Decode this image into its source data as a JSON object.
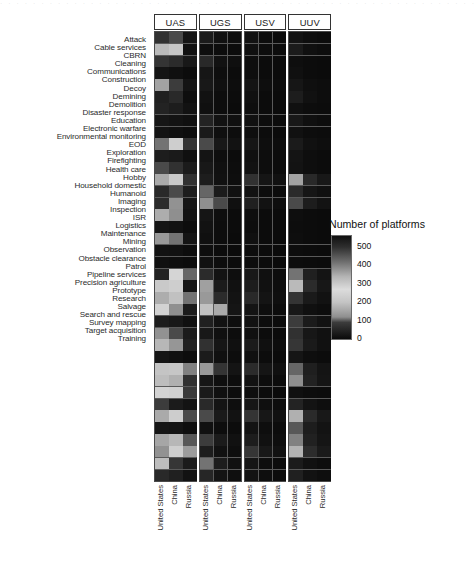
{
  "figure": {
    "kind": "faceted-heatmap",
    "legend_title": "Number of platforms",
    "legend_ticks": [
      "500",
      "400",
      "300",
      "200",
      "100",
      "0"
    ]
  },
  "panels": [
    {
      "label": "UAS"
    },
    {
      "label": "UGS"
    },
    {
      "label": "USV"
    },
    {
      "label": "UUV"
    }
  ],
  "countries": [
    "United States",
    "China",
    "Russia"
  ],
  "chart_data": {
    "type": "heatmap",
    "title": "",
    "xlabel": "",
    "ylabel": "",
    "legend_title": "Number of platforms",
    "legend_position": "right",
    "grid": true,
    "colorbar": {
      "ticks": [
        0,
        100,
        200,
        300,
        400,
        500
      ],
      "zlim": [
        0,
        560
      ],
      "scale_note": "non-monotonic grayscale: dark near 0, light near 250-300, dark again above 500",
      "stops": [
        {
          "value": 0,
          "color": "#0a0a0a"
        },
        {
          "value": 90,
          "color": "#3c3c3c"
        },
        {
          "value": 120,
          "color": "#8f8f8f"
        },
        {
          "value": 200,
          "color": "#c4c4c4"
        },
        {
          "value": 270,
          "color": "#dcdcdc"
        },
        {
          "value": 340,
          "color": "#b4b4b4"
        },
        {
          "value": 420,
          "color": "#6e6e6e"
        },
        {
          "value": 500,
          "color": "#2e2e2e"
        },
        {
          "value": 560,
          "color": "#101010"
        }
      ]
    },
    "facets": [
      "UAS",
      "UGS",
      "USV",
      "UUV"
    ],
    "x": [
      "United States",
      "China",
      "Russia"
    ],
    "y": [
      "Attack",
      "Cable services",
      "CBRN",
      "Cleaning",
      "Communications",
      "Construction",
      "Decoy",
      "Demining",
      "Demolition",
      "Disaster response",
      "Education",
      "Electronic warfare",
      "Environmental monitoring",
      "EOD",
      "Exploration",
      "Firefighting",
      "Health care",
      "Hobby",
      "Household domestic",
      "Humanoid",
      "Imaging",
      "Inspection",
      "ISR",
      "Logistics",
      "Maintenance",
      "Mining",
      "Observation",
      "Obstacle clearance",
      "Patrol",
      "Pipeline services",
      "Precision agriculture",
      "Prototype",
      "Research",
      "Salvage",
      "Search and rescue",
      "Survey mapping",
      "Target acquisition",
      "Training"
    ],
    "values": {
      "UAS": [
        [
          70,
          95,
          20
        ],
        [
          185,
          205,
          12
        ],
        [
          75,
          60,
          25
        ],
        [
          18,
          10,
          4
        ],
        [
          150,
          90,
          18
        ],
        [
          40,
          55,
          8
        ],
        [
          45,
          35,
          14
        ],
        [
          22,
          16,
          10
        ],
        [
          16,
          10,
          6
        ],
        [
          110,
          230,
          75
        ],
        [
          35,
          28,
          10
        ],
        [
          95,
          70,
          30
        ],
        [
          160,
          215,
          70
        ],
        [
          55,
          95,
          35
        ],
        [
          60,
          125,
          22
        ],
        [
          165,
          120,
          16
        ],
        [
          20,
          14,
          6
        ],
        [
          135,
          110,
          18
        ],
        [
          14,
          12,
          5
        ],
        [
          10,
          8,
          4
        ],
        [
          45,
          250,
          105
        ],
        [
          215,
          230,
          20
        ],
        [
          165,
          195,
          110
        ],
        [
          240,
          120,
          30
        ],
        [
          35,
          26,
          10
        ],
        [
          125,
          95,
          30
        ],
        [
          180,
          130,
          40
        ],
        [
          20,
          12,
          6
        ],
        [
          200,
          205,
          115
        ],
        [
          190,
          170,
          70
        ],
        [
          245,
          235,
          85
        ],
        [
          90,
          30,
          16
        ],
        [
          160,
          225,
          95
        ],
        [
          22,
          18,
          8
        ],
        [
          155,
          180,
          100
        ],
        [
          125,
          230,
          140
        ],
        [
          190,
          80,
          30
        ],
        [
          55,
          40,
          14
        ]
      ],
      "UGS": [
        [
          30,
          12,
          8
        ],
        [
          8,
          5,
          3
        ],
        [
          55,
          14,
          9
        ],
        [
          22,
          8,
          4
        ],
        [
          26,
          10,
          6
        ],
        [
          14,
          6,
          3
        ],
        [
          10,
          5,
          2
        ],
        [
          45,
          14,
          10
        ],
        [
          28,
          9,
          5
        ],
        [
          95,
          26,
          14
        ],
        [
          18,
          7,
          4
        ],
        [
          26,
          10,
          6
        ],
        [
          34,
          12,
          7
        ],
        [
          105,
          30,
          12
        ],
        [
          120,
          95,
          10
        ],
        [
          20,
          8,
          4
        ],
        [
          14,
          6,
          3
        ],
        [
          10,
          5,
          2
        ],
        [
          8,
          4,
          2
        ],
        [
          12,
          5,
          3
        ],
        [
          60,
          16,
          8
        ],
        [
          145,
          30,
          12
        ],
        [
          135,
          60,
          16
        ],
        [
          195,
          160,
          20
        ],
        [
          40,
          14,
          7
        ],
        [
          26,
          10,
          5
        ],
        [
          70,
          22,
          10
        ],
        [
          30,
          11,
          6
        ],
        [
          135,
          75,
          18
        ],
        [
          22,
          9,
          5
        ],
        [
          28,
          11,
          6
        ],
        [
          55,
          18,
          8
        ],
        [
          95,
          28,
          14
        ],
        [
          10,
          5,
          3
        ],
        [
          90,
          30,
          13
        ],
        [
          34,
          12,
          7
        ],
        [
          110,
          34,
          12
        ],
        [
          50,
          18,
          9
        ]
      ],
      "USV": [
        [
          14,
          6,
          4
        ],
        [
          10,
          5,
          3
        ],
        [
          8,
          4,
          2
        ],
        [
          8,
          4,
          2
        ],
        [
          18,
          7,
          4
        ],
        [
          10,
          4,
          2
        ],
        [
          8,
          4,
          2
        ],
        [
          12,
          5,
          3
        ],
        [
          8,
          4,
          2
        ],
        [
          22,
          8,
          5
        ],
        [
          10,
          5,
          3
        ],
        [
          14,
          6,
          3
        ],
        [
          70,
          20,
          12
        ],
        [
          14,
          6,
          3
        ],
        [
          40,
          14,
          8
        ],
        [
          8,
          4,
          2
        ],
        [
          6,
          3,
          2
        ],
        [
          10,
          4,
          2
        ],
        [
          6,
          3,
          2
        ],
        [
          5,
          3,
          2
        ],
        [
          26,
          10,
          5
        ],
        [
          34,
          12,
          7
        ],
        [
          55,
          18,
          9
        ],
        [
          18,
          7,
          4
        ],
        [
          14,
          6,
          3
        ],
        [
          10,
          4,
          2
        ],
        [
          30,
          11,
          6
        ],
        [
          10,
          4,
          2
        ],
        [
          60,
          20,
          10
        ],
        [
          14,
          6,
          3
        ],
        [
          8,
          4,
          2
        ],
        [
          22,
          9,
          5
        ],
        [
          75,
          24,
          12
        ],
        [
          16,
          7,
          4
        ],
        [
          34,
          13,
          7
        ],
        [
          80,
          26,
          14
        ],
        [
          20,
          8,
          4
        ],
        [
          16,
          7,
          4
        ]
      ],
      "UUV": [
        [
          16,
          7,
          4
        ],
        [
          30,
          11,
          6
        ],
        [
          8,
          4,
          2
        ],
        [
          10,
          4,
          2
        ],
        [
          22,
          9,
          5
        ],
        [
          35,
          12,
          6
        ],
        [
          10,
          5,
          3
        ],
        [
          26,
          10,
          6
        ],
        [
          12,
          5,
          3
        ],
        [
          30,
          12,
          7
        ],
        [
          18,
          8,
          4
        ],
        [
          16,
          7,
          4
        ],
        [
          150,
          55,
          26
        ],
        [
          60,
          22,
          11
        ],
        [
          95,
          34,
          16
        ],
        [
          8,
          4,
          2
        ],
        [
          6,
          3,
          2
        ],
        [
          8,
          4,
          2
        ],
        [
          6,
          3,
          2
        ],
        [
          5,
          3,
          2
        ],
        [
          110,
          40,
          18
        ],
        [
          185,
          60,
          24
        ],
        [
          75,
          28,
          14
        ],
        [
          26,
          10,
          6
        ],
        [
          90,
          30,
          14
        ],
        [
          70,
          24,
          12
        ],
        [
          80,
          28,
          13
        ],
        [
          20,
          8,
          4
        ],
        [
          105,
          38,
          18
        ],
        [
          120,
          44,
          20
        ],
        [
          10,
          5,
          3
        ],
        [
          45,
          16,
          8
        ],
        [
          170,
          58,
          26
        ],
        [
          100,
          34,
          16
        ],
        [
          115,
          42,
          20
        ],
        [
          175,
          62,
          28
        ],
        [
          30,
          12,
          6
        ],
        [
          40,
          15,
          8
        ]
      ]
    }
  },
  "artifact": {
    "top_noise": "· · · · · · · · · · · · · · · · · · · · · · · · · · · · · · · · · · · · · · · · · · · · · · · · · · · · · · · · · · · ·"
  }
}
